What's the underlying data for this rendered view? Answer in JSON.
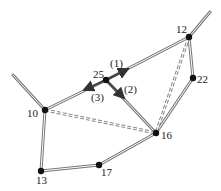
{
  "diagram": {
    "nodes": [
      {
        "id": "12",
        "label": "12",
        "x": 189,
        "y": 37
      },
      {
        "id": "22",
        "label": "22",
        "x": 193,
        "y": 78
      },
      {
        "id": "25",
        "label": "25",
        "x": 106,
        "y": 80
      },
      {
        "id": "10",
        "label": "10",
        "x": 45,
        "y": 110
      },
      {
        "id": "16",
        "label": "16",
        "x": 156,
        "y": 133
      },
      {
        "id": "17",
        "label": "17",
        "x": 99,
        "y": 165
      },
      {
        "id": "13",
        "label": "13",
        "x": 41,
        "y": 171
      }
    ],
    "edges": [
      {
        "from": "12",
        "to": "25",
        "style": "double"
      },
      {
        "from": "25",
        "to": "10",
        "style": "double"
      },
      {
        "from": "25",
        "to": "16",
        "style": "double"
      },
      {
        "from": "12",
        "to": "22",
        "style": "double"
      },
      {
        "from": "22",
        "to": "16",
        "style": "double"
      },
      {
        "from": "10",
        "to": "13",
        "style": "double"
      },
      {
        "from": "13",
        "to": "17",
        "style": "double"
      },
      {
        "from": "17",
        "to": "16",
        "style": "double"
      },
      {
        "from": "10",
        "to": "16",
        "style": "dashed-double"
      },
      {
        "from": "12",
        "to": "16",
        "style": "dashed-double"
      }
    ],
    "arrows": [
      {
        "label": "(1)",
        "from": "25",
        "direction": "toward 12"
      },
      {
        "label": "(2)",
        "from": "25",
        "direction": "toward 16"
      },
      {
        "label": "(3)",
        "from": "25",
        "direction": "toward 10"
      }
    ],
    "labels": {
      "n12": "12",
      "n22": "22",
      "n25": "25",
      "n10": "10",
      "n16": "16",
      "n17": "17",
      "n13": "13",
      "a1": "(1)",
      "a2": "(2)",
      "a3": "(3)"
    }
  }
}
